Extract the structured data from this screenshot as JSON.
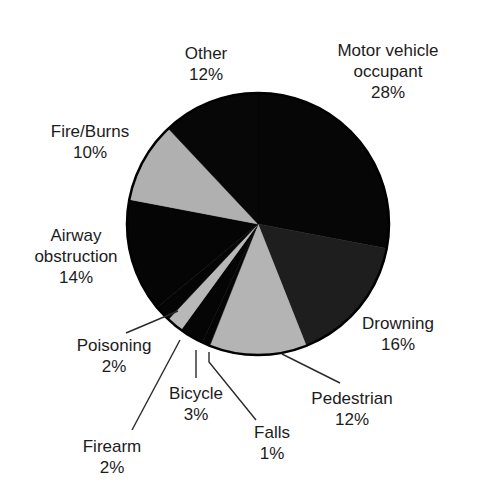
{
  "chart_data": {
    "type": "pie",
    "title": "",
    "start_angle_deg": 0,
    "direction": "clockwise",
    "center": [
      258,
      224
    ],
    "radius": 131,
    "slices": [
      {
        "label": "Motor vehicle occupant",
        "lines": [
          "Motor vehicle",
          "occupant"
        ],
        "value": 28,
        "pct_text": "28%",
        "color": "#060606",
        "label_pos": [
          388,
          40
        ]
      },
      {
        "label": "Drowning",
        "lines": [
          "Drowning"
        ],
        "value": 16,
        "pct_text": "16%",
        "color": "#1e1e1e",
        "label_pos": [
          398,
          313
        ]
      },
      {
        "label": "Pedestrian",
        "lines": [
          "Pedestrian"
        ],
        "value": 12,
        "pct_text": "12%",
        "color": "#b4b4b4",
        "label_pos": [
          352,
          388
        ]
      },
      {
        "label": "Falls",
        "lines": [
          "Falls"
        ],
        "value": 1,
        "pct_text": "1%",
        "color": "#050505",
        "label_pos": [
          272,
          422
        ]
      },
      {
        "label": "Bicycle",
        "lines": [
          "Bicycle"
        ],
        "value": 3,
        "pct_text": "3%",
        "color": "#050505",
        "label_pos": [
          196,
          383
        ]
      },
      {
        "label": "Firearm",
        "lines": [
          "Firearm"
        ],
        "value": 2,
        "pct_text": "2%",
        "color": "#b8b8b8",
        "label_pos": [
          112,
          436
        ]
      },
      {
        "label": "Poisoning",
        "lines": [
          "Poisoning"
        ],
        "value": 2,
        "pct_text": "2%",
        "color": "#050505",
        "label_pos": [
          114,
          335
        ]
      },
      {
        "label": "Airway obstruction",
        "lines": [
          "Airway",
          "obstruction"
        ],
        "value": 14,
        "pct_text": "14%",
        "color": "#050505",
        "label_pos": [
          76,
          225
        ]
      },
      {
        "label": "Fire/Burns",
        "lines": [
          "Fire/Burns"
        ],
        "value": 10,
        "pct_text": "10%",
        "color": "#b0b0b0",
        "label_pos": [
          90,
          121
        ]
      },
      {
        "label": "Other",
        "lines": [
          "Other"
        ],
        "value": 12,
        "pct_text": "12%",
        "color": "#070707",
        "label_pos": [
          206,
          43
        ]
      }
    ],
    "leader_lines": [
      {
        "slice": "Pedestrian",
        "from": [
          282,
          354
        ],
        "to": [
          340,
          383
        ]
      },
      {
        "slice": "Falls",
        "from": [
          209,
          352
        ],
        "to": [
          209,
          362
        ],
        "to2": [
          256,
          420
        ]
      },
      {
        "slice": "Bicycle",
        "from": [
          196,
          350
        ],
        "to": [
          196,
          378
        ]
      },
      {
        "slice": "Firearm",
        "from": [
          180,
          340
        ],
        "to": [
          132,
          430
        ]
      },
      {
        "slice": "Poisoning",
        "from": [
          178,
          311
        ],
        "to": [
          126,
          333
        ]
      }
    ],
    "legend": null,
    "axes": null
  }
}
